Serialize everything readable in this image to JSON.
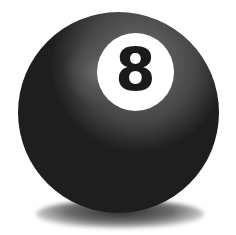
{
  "image": {
    "subject": "billiard eight ball",
    "ball": {
      "number": "8",
      "body_color": "#1e1e1e",
      "label_color": "#ffffff",
      "number_color": "#1a1a1a"
    },
    "background_color": "#ffffff"
  }
}
